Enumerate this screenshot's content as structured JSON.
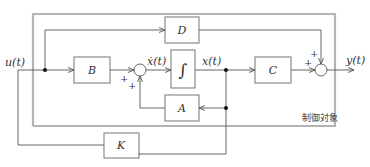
{
  "diagram": {
    "plant_label": "制御対象",
    "blocks": {
      "B": "B",
      "D": "D",
      "A": "A",
      "C": "C",
      "K": "K",
      "integrator": "∫"
    },
    "signals": {
      "input": "u(t)",
      "state_derivative": "ẋ(t)",
      "state": "x(t)",
      "output": "y(t)"
    },
    "sum_signs": {
      "sum1_from_B": "+",
      "sum1_from_A": "+",
      "sum2_from_C": "+",
      "sum2_from_D": "+"
    },
    "colors": {
      "wire": "#555555",
      "plant_border": "#b3b3b3",
      "junction_dot": "#111111"
    }
  }
}
